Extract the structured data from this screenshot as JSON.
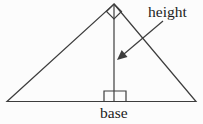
{
  "diagram": {
    "labels": {
      "height": "height",
      "base": "base"
    },
    "colors": {
      "line": "#3d3d3d",
      "text": "#1c1c1c",
      "background": "#fcfcfc"
    }
  }
}
